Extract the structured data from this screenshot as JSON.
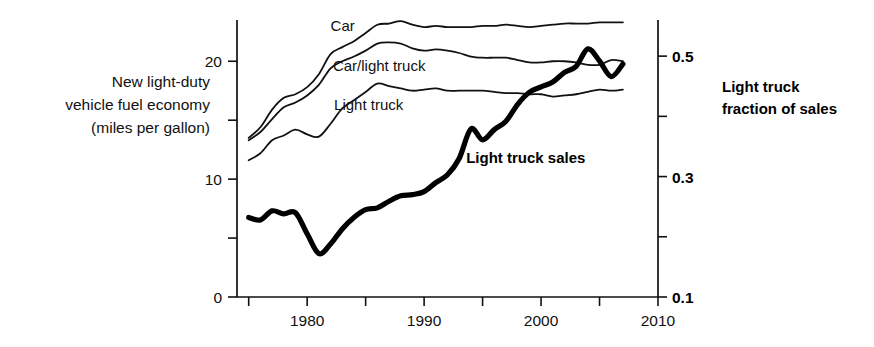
{
  "figure": {
    "left_axis_title_lines": [
      "New light-duty",
      "vehicle fuel economy",
      "(miles per gallon)"
    ],
    "right_axis_title_lines": [
      "Light truck",
      "fraction of sales"
    ],
    "ink_color": "#111111"
  },
  "chart_data": {
    "type": "line",
    "title": "",
    "subtitle": "",
    "xlabel": "",
    "ylabel": "New light-duty vehicle fuel economy (miles per gallon)",
    "y2label": "Light truck fraction of sales",
    "xlim": [
      1974,
      2010
    ],
    "ylim": [
      0,
      23.5
    ],
    "y2lim": [
      0.1,
      0.56
    ],
    "grid": false,
    "legend": "inline-labels",
    "xticks": [
      1975,
      1980,
      1985,
      1990,
      1995,
      2000,
      2005,
      2010
    ],
    "xticklabels": [
      "",
      "1980",
      "",
      "1990",
      "",
      "2000",
      "",
      "2010"
    ],
    "yticks": [
      0,
      5,
      10,
      15,
      20
    ],
    "yticklabels": [
      "0",
      "",
      "10",
      "",
      "20"
    ],
    "y2ticks": [
      0.1,
      0.2,
      0.3,
      0.4,
      0.5
    ],
    "y2ticklabels": [
      "0.1",
      "",
      "0.3",
      "",
      "0.5"
    ],
    "annotations": [
      {
        "text": "Car",
        "x": 1982.0,
        "y": 22.6,
        "bold": false
      },
      {
        "text": "Car/light truck",
        "x": 1982.2,
        "y": 19.2,
        "bold": false
      },
      {
        "text": "Light truck",
        "x": 1982.3,
        "y": 15.9,
        "bold": false
      },
      {
        "text": "Light truck sales",
        "x": 1993.6,
        "y": 11.4,
        "bold": true
      }
    ],
    "series": [
      {
        "name": "Car",
        "axis": "left",
        "style": "thin",
        "x": [
          1975,
          1976,
          1977,
          1978,
          1979,
          1980,
          1981,
          1982,
          1983,
          1984,
          1985,
          1986,
          1987,
          1988,
          1989,
          1990,
          1991,
          1992,
          1993,
          1994,
          1995,
          1996,
          1997,
          1998,
          1999,
          2000,
          2001,
          2002,
          2003,
          2004,
          2005,
          2006,
          2007
        ],
        "y": [
          13.5,
          14.4,
          15.9,
          16.9,
          17.2,
          17.8,
          18.9,
          20.6,
          21.2,
          21.7,
          22.4,
          23.1,
          23.2,
          23.4,
          23.1,
          22.9,
          23.0,
          22.9,
          22.9,
          22.9,
          23.0,
          23.0,
          23.1,
          23.0,
          22.9,
          23.0,
          23.1,
          23.2,
          23.2,
          23.2,
          23.3,
          23.3,
          23.3
        ],
        "unit": "mpg"
      },
      {
        "name": "Car/light truck",
        "axis": "left",
        "style": "thin",
        "x": [
          1975,
          1976,
          1977,
          1978,
          1979,
          1980,
          1981,
          1982,
          1983,
          1984,
          1985,
          1986,
          1987,
          1988,
          1989,
          1990,
          1991,
          1992,
          1993,
          1994,
          1995,
          1996,
          1997,
          1998,
          1999,
          2000,
          2001,
          2002,
          2003,
          2004,
          2005,
          2006,
          2007
        ],
        "y": [
          13.3,
          14.0,
          15.1,
          16.1,
          16.5,
          17.1,
          18.0,
          19.4,
          20.0,
          20.4,
          20.9,
          21.5,
          21.6,
          21.5,
          21.1,
          20.9,
          21.0,
          20.9,
          20.7,
          20.4,
          20.3,
          20.3,
          20.3,
          20.1,
          19.9,
          19.9,
          20.0,
          20.0,
          19.9,
          19.7,
          19.7,
          20.1,
          20.0
        ],
        "unit": "mpg"
      },
      {
        "name": "Light truck",
        "axis": "left",
        "style": "thin",
        "x": [
          1975,
          1976,
          1977,
          1978,
          1979,
          1980,
          1981,
          1982,
          1983,
          1984,
          1985,
          1986,
          1987,
          1988,
          1989,
          1990,
          1991,
          1992,
          1993,
          1994,
          1995,
          1996,
          1997,
          1998,
          1999,
          2000,
          2001,
          2002,
          2003,
          2004,
          2005,
          2006,
          2007
        ],
        "y": [
          11.6,
          12.2,
          13.3,
          13.7,
          14.2,
          13.8,
          13.6,
          14.7,
          16.0,
          16.7,
          17.4,
          18.1,
          17.9,
          17.7,
          17.5,
          17.6,
          17.7,
          17.5,
          17.5,
          17.5,
          17.5,
          17.4,
          17.3,
          17.3,
          17.2,
          17.2,
          17.0,
          17.1,
          17.2,
          17.4,
          17.6,
          17.5,
          17.6
        ],
        "unit": "mpg"
      },
      {
        "name": "Light truck sales",
        "axis": "right",
        "style": "thick",
        "x": [
          1975,
          1976,
          1977,
          1978,
          1979,
          1980,
          1981,
          1982,
          1983,
          1984,
          1985,
          1986,
          1987,
          1988,
          1989,
          1990,
          1991,
          1992,
          1993,
          1994,
          1995,
          1996,
          1997,
          1998,
          1999,
          2000,
          2001,
          2002,
          2003,
          2004,
          2005,
          2006,
          2007
        ],
        "y": [
          0.232,
          0.228,
          0.243,
          0.238,
          0.24,
          0.205,
          0.172,
          0.188,
          0.213,
          0.232,
          0.245,
          0.248,
          0.259,
          0.268,
          0.27,
          0.275,
          0.29,
          0.303,
          0.33,
          0.379,
          0.361,
          0.378,
          0.392,
          0.42,
          0.44,
          0.449,
          0.457,
          0.473,
          0.483,
          0.512,
          0.492,
          0.466,
          0.487
        ],
        "unit": "fraction of sales"
      }
    ]
  }
}
